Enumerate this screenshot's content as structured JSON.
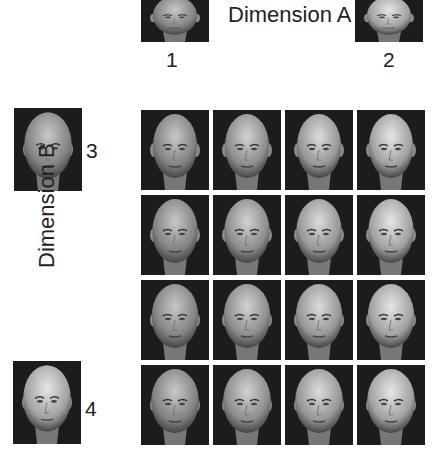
{
  "figure": {
    "dimension_a_label": "Dimension A",
    "dimension_b_label": "Dimension B",
    "anchors": [
      {
        "id": "1",
        "label": "1",
        "axis": "Dimension A",
        "end": "start"
      },
      {
        "id": "2",
        "label": "2",
        "axis": "Dimension A",
        "end": "end"
      },
      {
        "id": "3",
        "label": "3",
        "axis": "Dimension B",
        "end": "start"
      },
      {
        "id": "4",
        "label": "4",
        "axis": "Dimension B",
        "end": "end"
      }
    ],
    "grid": {
      "rows": 4,
      "cols": 4,
      "description": "4x4 morphed face stimuli grid varying along Dimension A (columns) and Dimension B (rows)",
      "cells": [
        [
          {
            "a": 0,
            "b": 0
          },
          {
            "a": 1,
            "b": 0
          },
          {
            "a": 2,
            "b": 0
          },
          {
            "a": 3,
            "b": 0
          }
        ],
        [
          {
            "a": 0,
            "b": 1
          },
          {
            "a": 1,
            "b": 1
          },
          {
            "a": 2,
            "b": 1
          },
          {
            "a": 3,
            "b": 1
          }
        ],
        [
          {
            "a": 0,
            "b": 2
          },
          {
            "a": 1,
            "b": 2
          },
          {
            "a": 2,
            "b": 2
          },
          {
            "a": 3,
            "b": 2
          }
        ],
        [
          {
            "a": 0,
            "b": 3
          },
          {
            "a": 1,
            "b": 3
          },
          {
            "a": 2,
            "b": 3
          },
          {
            "a": 3,
            "b": 3
          }
        ]
      ]
    }
  }
}
